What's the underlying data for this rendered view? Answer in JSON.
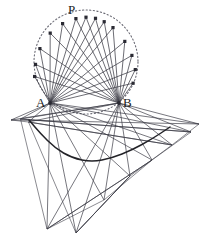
{
  "figure": {
    "width": 215,
    "height": 251,
    "background_color": "#ffffff",
    "stroke_color": "#3c3c46",
    "dot_color": "#2a2a33",
    "envelope_color": "#232328",
    "dash_color": "#6b6b75"
  },
  "labels": {
    "P": "P",
    "A": "A",
    "B": "B"
  },
  "chart_data": {
    "type": "scatter",
    "xlabel": "",
    "ylabel": "",
    "xlim": [
      0,
      215
    ],
    "ylim": [
      0,
      251
    ],
    "grid": false,
    "legend": "none",
    "annotations": [
      "P",
      "A",
      "B"
    ],
    "circle": {
      "cx": 86.0,
      "cy": 62.0,
      "r": 52.0,
      "style": "dotted"
    },
    "anchors": {
      "A": {
        "x": 50.0,
        "y": 103.0
      },
      "B": {
        "x": 119.0,
        "y": 103.0
      }
    },
    "points_on_circle": [
      {
        "name": "P1",
        "x": 34.6,
        "y": 76.5
      },
      {
        "name": "P2",
        "x": 35.5,
        "y": 64.4
      },
      {
        "name": "P3",
        "x": 39.9,
        "y": 48.6
      },
      {
        "name": "P4",
        "x": 50.2,
        "y": 33.1
      },
      {
        "name": "P5",
        "x": 62.6,
        "y": 23.6
      },
      {
        "name": "P6",
        "x": 75.9,
        "y": 18.6
      },
      {
        "name": "P",
        "x": 86.0,
        "y": 17.2
      },
      {
        "name": "P7",
        "x": 95.5,
        "y": 18.3
      },
      {
        "name": "P8",
        "x": 104.2,
        "y": 21.7
      },
      {
        "name": "P9",
        "x": 113.0,
        "y": 27.6
      },
      {
        "name": "P10",
        "x": 124.8,
        "y": 41.4
      },
      {
        "name": "P11",
        "x": 131.9,
        "y": 55.4
      },
      {
        "name": "P12",
        "x": 135.3,
        "y": 69.6
      },
      {
        "name": "P13",
        "x": 133.1,
        "y": 83.2
      }
    ],
    "apex_points": [
      {
        "name": "Q1",
        "x": 11.0,
        "y": 120.0
      },
      {
        "name": "Q2",
        "x": 20.5,
        "y": 119.0
      },
      {
        "name": "Q3",
        "x": 28.5,
        "y": 122.0
      },
      {
        "name": "Q4",
        "x": 47.0,
        "y": 229.0
      },
      {
        "name": "Q5",
        "x": 76.0,
        "y": 233.0
      },
      {
        "name": "Q6",
        "x": 104.0,
        "y": 200.0
      },
      {
        "name": "Q7",
        "x": 130.0,
        "y": 176.0
      },
      {
        "name": "Q8",
        "x": 152.0,
        "y": 160.0
      },
      {
        "name": "Q9",
        "x": 172.0,
        "y": 145.0
      },
      {
        "name": "Q10",
        "x": 191.0,
        "y": 132.0
      },
      {
        "name": "Q11",
        "x": 199.0,
        "y": 124.0
      }
    ],
    "envelope_curve": [
      {
        "x": 29.0,
        "y": 120.0
      },
      {
        "x": 40.0,
        "y": 133.0
      },
      {
        "x": 55.0,
        "y": 148.0
      },
      {
        "x": 72.0,
        "y": 158.0
      },
      {
        "x": 92.0,
        "y": 162.0
      },
      {
        "x": 112.0,
        "y": 158.0
      },
      {
        "x": 132.0,
        "y": 150.0
      },
      {
        "x": 152.0,
        "y": 139.0
      },
      {
        "x": 170.0,
        "y": 127.0
      }
    ]
  }
}
